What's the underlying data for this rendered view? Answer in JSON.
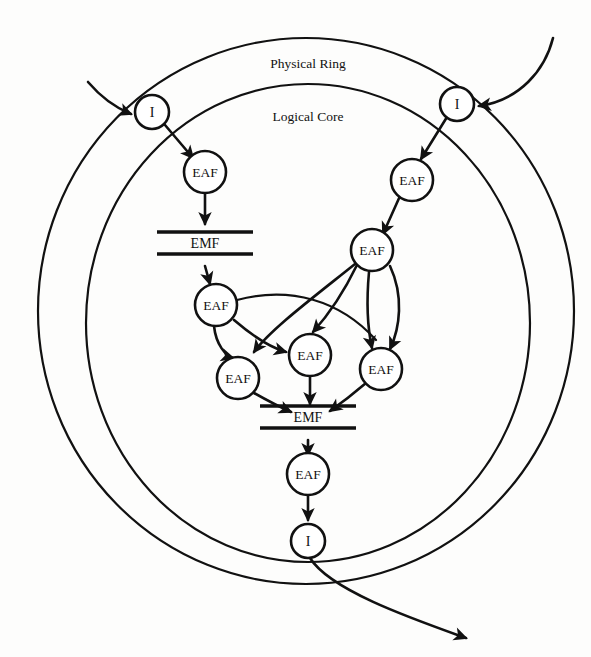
{
  "figure": {
    "type": "node-link-diagram",
    "width": 591,
    "height": 657,
    "background_color": "#fdfdfc",
    "stroke_color": "#111111"
  },
  "rings": {
    "outer": {
      "label": "Physical Ring",
      "cx": 306,
      "cy": 311,
      "rx": 268,
      "ry": 273
    },
    "inner": {
      "label": "Logical Core",
      "cx": 308,
      "cy": 323,
      "rx": 222,
      "ry": 239
    }
  },
  "labels": {
    "physical_ring": "Physical Ring",
    "logical_core": "Logical Core",
    "interface": "I",
    "eaf": "EAF",
    "emf": "EMF"
  },
  "nodes": [
    {
      "id": "i-left",
      "label": "I",
      "kind": "interface",
      "cx": 152,
      "cy": 112,
      "r": 17
    },
    {
      "id": "i-right",
      "label": "I",
      "kind": "interface",
      "cx": 457,
      "cy": 104,
      "r": 17
    },
    {
      "id": "i-bottom",
      "label": "I",
      "kind": "interface",
      "cx": 308,
      "cy": 541,
      "r": 17
    },
    {
      "id": "eaf-l1",
      "label": "EAF",
      "kind": "agent",
      "cx": 205,
      "cy": 172,
      "r": 21
    },
    {
      "id": "eaf-r1",
      "label": "EAF",
      "kind": "agent",
      "cx": 412,
      "cy": 180,
      "r": 21
    },
    {
      "id": "eaf-r2",
      "label": "EAF",
      "kind": "agent",
      "cx": 372,
      "cy": 250,
      "r": 21
    },
    {
      "id": "eaf-c1",
      "label": "EAF",
      "kind": "agent",
      "cx": 216,
      "cy": 305,
      "r": 21
    },
    {
      "id": "eaf-c2",
      "label": "EAF",
      "kind": "agent",
      "cx": 238,
      "cy": 378,
      "r": 21
    },
    {
      "id": "eaf-c3",
      "label": "EAF",
      "kind": "agent",
      "cx": 310,
      "cy": 355,
      "r": 21
    },
    {
      "id": "eaf-c4",
      "label": "EAF",
      "kind": "agent",
      "cx": 381,
      "cy": 369,
      "r": 21
    },
    {
      "id": "eaf-out",
      "label": "EAF",
      "kind": "agent",
      "cx": 308,
      "cy": 474,
      "r": 21
    }
  ],
  "stores": [
    {
      "id": "emf-top",
      "label": "EMF",
      "cx": 205,
      "cy": 243,
      "half_width": 48,
      "gap": 22
    },
    {
      "id": "emf-bottom",
      "label": "EMF",
      "cx": 308,
      "cy": 417,
      "half_width": 48,
      "gap": 22
    }
  ],
  "edges": [
    {
      "from": "external-left",
      "to": "i-left",
      "style": "curved-inbound"
    },
    {
      "from": "external-right",
      "to": "i-right",
      "style": "curved-inbound"
    },
    {
      "from": "i-left",
      "to": "eaf-l1",
      "style": "straight"
    },
    {
      "from": "i-right",
      "to": "eaf-r1",
      "style": "straight"
    },
    {
      "from": "eaf-l1",
      "to": "emf-top",
      "style": "straight"
    },
    {
      "from": "emf-top",
      "to": "eaf-c1",
      "style": "straight"
    },
    {
      "from": "eaf-r1",
      "to": "eaf-r2",
      "style": "straight"
    },
    {
      "from": "eaf-c1",
      "to": "eaf-c2",
      "style": "curved"
    },
    {
      "from": "eaf-c1",
      "to": "eaf-c3",
      "style": "curved"
    },
    {
      "from": "eaf-c1",
      "to": "eaf-c4",
      "style": "long-curve-right"
    },
    {
      "from": "eaf-r2",
      "to": "eaf-c2",
      "style": "long-curve-left"
    },
    {
      "from": "eaf-r2",
      "to": "eaf-c3",
      "style": "curved"
    },
    {
      "from": "eaf-r2",
      "to": "eaf-c4",
      "style": "curved"
    },
    {
      "from": "eaf-r2",
      "to": "eaf-c4b",
      "style": "curved-outer"
    },
    {
      "from": "eaf-c2",
      "to": "emf-bottom",
      "style": "curved"
    },
    {
      "from": "eaf-c3",
      "to": "emf-bottom",
      "style": "straight"
    },
    {
      "from": "eaf-c4",
      "to": "emf-bottom",
      "style": "curved"
    },
    {
      "from": "emf-bottom",
      "to": "eaf-out",
      "style": "straight"
    },
    {
      "from": "eaf-out",
      "to": "i-bottom",
      "style": "straight"
    },
    {
      "from": "i-bottom",
      "to": "external-bottom",
      "style": "curved-outbound"
    }
  ]
}
